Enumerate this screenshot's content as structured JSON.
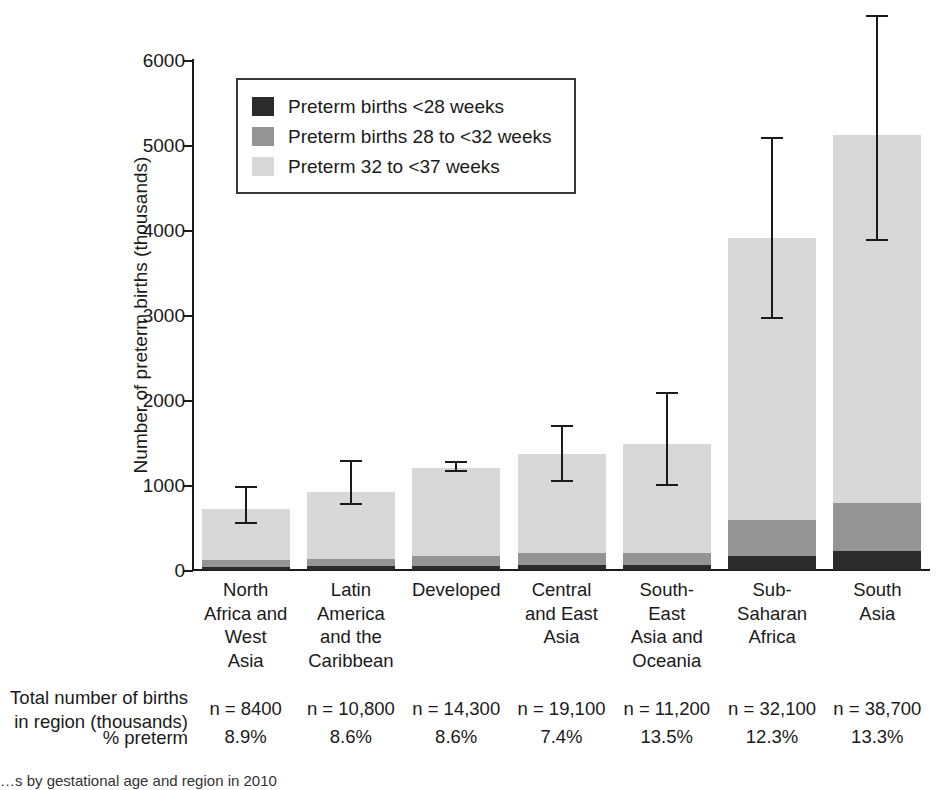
{
  "chart_data": {
    "type": "bar",
    "subtype": "stacked-bar-with-error-bars",
    "title": "",
    "xlabel": "",
    "ylabel": "Number of preterm births (thousands)",
    "ylim": [
      0,
      6000
    ],
    "yticks": [
      0,
      1000,
      2000,
      3000,
      4000,
      5000,
      6000
    ],
    "ytick_labels": [
      "0",
      "1000",
      "2000",
      "3000",
      "4000",
      "5000",
      "6000"
    ],
    "grid": false,
    "legend_position": "upper-left-inside",
    "categories": [
      "North Africa and West Asia",
      "Latin America and the Caribbean",
      "Developed",
      "Central and East Asia",
      "South-East Asia and Oceania",
      "Sub-Saharan Africa",
      "South Asia"
    ],
    "category_label_lines": [
      [
        "North",
        "Africa and",
        "West",
        "Asia"
      ],
      [
        "Latin",
        "America",
        "and the",
        "Caribbean"
      ],
      [
        "Developed"
      ],
      [
        "Central",
        "and East",
        "Asia"
      ],
      [
        "South-",
        "East",
        "Asia and",
        "Oceania"
      ],
      [
        "Sub-",
        "Saharan",
        "Africa"
      ],
      [
        "South",
        "Asia"
      ]
    ],
    "series": [
      {
        "name": "Preterm births <28 weeks",
        "color": "#2b2b2b",
        "values": [
          40,
          45,
          50,
          60,
          60,
          165,
          225
        ]
      },
      {
        "name": "Preterm births 28 to <32 weeks",
        "color": "#949494",
        "values": [
          75,
          85,
          110,
          140,
          145,
          425,
          565
        ]
      },
      {
        "name": "Preterm 32 to <37 weeks",
        "color": "#d8d8d8",
        "values": [
          605,
          790,
          1040,
          1170,
          1275,
          3320,
          4330
        ]
      }
    ],
    "totals": [
      720,
      920,
      1200,
      1370,
      1480,
      3910,
      5120
    ],
    "error_bars": [
      {
        "category": "North Africa and West Asia",
        "low": 540,
        "high": 990
      },
      {
        "category": "Latin America and the Caribbean",
        "low": 760,
        "high": 1300
      },
      {
        "category": "Developed",
        "low": 1150,
        "high": 1280
      },
      {
        "category": "Central and East Asia",
        "low": 1030,
        "high": 1710
      },
      {
        "category": "South-East Asia and Oceania",
        "low": 990,
        "high": 2100
      },
      {
        "category": "Sub-Saharan Africa",
        "low": 2950,
        "high": 5100
      },
      {
        "category": "South Asia",
        "low": 3870,
        "high": 6530
      }
    ]
  },
  "legend": {
    "items": [
      {
        "label": "Preterm births <28 weeks",
        "color": "#2b2b2b"
      },
      {
        "label": "Preterm births 28 to <32 weeks",
        "color": "#949494"
      },
      {
        "label": "Preterm 32 to <37 weeks",
        "color": "#d8d8d8"
      }
    ]
  },
  "axis": {
    "y_title": "Number of preterm births (thousands)",
    "y_ticks": [
      "6000",
      "5000",
      "4000",
      "3000",
      "2000",
      "1000",
      "0"
    ]
  },
  "table": {
    "rows": [
      {
        "label_line1": "Total number of births",
        "label_line2": "in region (thousands)",
        "values": [
          "n = 8400",
          "n = 10,800",
          "n = 14,300",
          "n = 19,100",
          "n = 11,200",
          "n = 32,100",
          "n = 38,700"
        ]
      },
      {
        "label_line1": "% preterm",
        "label_line2": "",
        "values": [
          "8.9%",
          "8.6%",
          "8.6%",
          "7.4%",
          "13.5%",
          "12.3%",
          "13.3%"
        ]
      }
    ]
  },
  "caption": {
    "text": "…s by gestational age and region in 2010"
  },
  "colors": {
    "dark": "#2b2b2b",
    "mid": "#949494",
    "light": "#d8d8d8",
    "axis": "#1a1a1a"
  }
}
